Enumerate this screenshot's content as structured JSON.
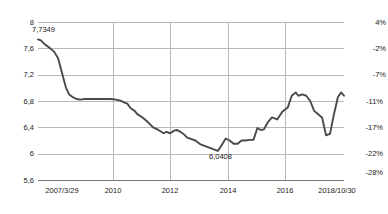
{
  "chart_data": {
    "type": "line",
    "title": "",
    "subtitle": "",
    "xlabel": "",
    "ylabel": "",
    "grid": true,
    "legend": false,
    "left_axis": {
      "label": "",
      "ticks": [
        "8",
        "7,6",
        "7,2",
        "6,8",
        "6,4",
        "6",
        "5,6"
      ],
      "tick_values": [
        8,
        7.6,
        7.2,
        6.8,
        6.4,
        6.0,
        5.6
      ],
      "ylim": [
        5.6,
        8.0
      ]
    },
    "right_axis": {
      "label": "",
      "ticks": [
        "4%",
        "-2%",
        "-7%",
        "-11%",
        "-17%",
        "-22%",
        "-28%"
      ],
      "tick_values": [
        4,
        -2,
        -7,
        -11,
        -17,
        -22,
        -28
      ]
    },
    "x_ticks": [
      "2007/3/29",
      "2010",
      "2012",
      "2014",
      "2016",
      "2018/10/30"
    ],
    "annotations": [
      {
        "text": "7,7349",
        "note": "series maximum at start of range"
      },
      {
        "text": "6,0408",
        "note": "series minimum near early 2014"
      }
    ],
    "series": [
      {
        "name": "rate",
        "color": "#4a4a4a",
        "x": [
          2007.24,
          2007.35,
          2007.5,
          2007.7,
          2007.85,
          2008.0,
          2008.1,
          2008.2,
          2008.3,
          2008.42,
          2008.55,
          2008.7,
          2008.85,
          2009.0,
          2009.2,
          2009.4,
          2009.6,
          2009.8,
          2010.0,
          2010.2,
          2010.4,
          2010.5,
          2010.62,
          2010.75,
          2010.9,
          2011.0,
          2011.2,
          2011.4,
          2011.6,
          2011.8,
          2012.0,
          2012.1,
          2012.25,
          2012.4,
          2012.5,
          2012.6,
          2012.75,
          2012.9,
          2013.0,
          2013.2,
          2013.4,
          2013.6,
          2013.8,
          2014.0,
          2014.05,
          2014.2,
          2014.35,
          2014.5,
          2014.65,
          2014.8,
          2014.95,
          2015.1,
          2015.25,
          2015.4,
          2015.55,
          2015.68,
          2015.8,
          2015.95,
          2016.1,
          2016.3,
          2016.5,
          2016.7,
          2016.85,
          2017.0,
          2017.1,
          2017.25,
          2017.4,
          2017.55,
          2017.7,
          2017.85,
          2018.0,
          2018.15,
          2018.3,
          2018.45,
          2018.6,
          2018.72,
          2018.83
        ],
        "y": [
          7.7349,
          7.72,
          7.66,
          7.6,
          7.55,
          7.45,
          7.3,
          7.15,
          7.0,
          6.9,
          6.86,
          6.83,
          6.82,
          6.83,
          6.83,
          6.83,
          6.83,
          6.83,
          6.83,
          6.82,
          6.8,
          6.78,
          6.76,
          6.69,
          6.65,
          6.6,
          6.55,
          6.48,
          6.4,
          6.36,
          6.31,
          6.33,
          6.31,
          6.35,
          6.36,
          6.34,
          6.3,
          6.24,
          6.23,
          6.2,
          6.14,
          6.11,
          6.08,
          6.05,
          6.0408,
          6.13,
          6.23,
          6.2,
          6.15,
          6.15,
          6.2,
          6.2,
          6.21,
          6.21,
          6.39,
          6.36,
          6.37,
          6.48,
          6.55,
          6.52,
          6.64,
          6.7,
          6.88,
          6.93,
          6.88,
          6.9,
          6.88,
          6.8,
          6.65,
          6.6,
          6.55,
          6.28,
          6.3,
          6.6,
          6.86,
          6.93,
          6.88
        ]
      }
    ]
  }
}
